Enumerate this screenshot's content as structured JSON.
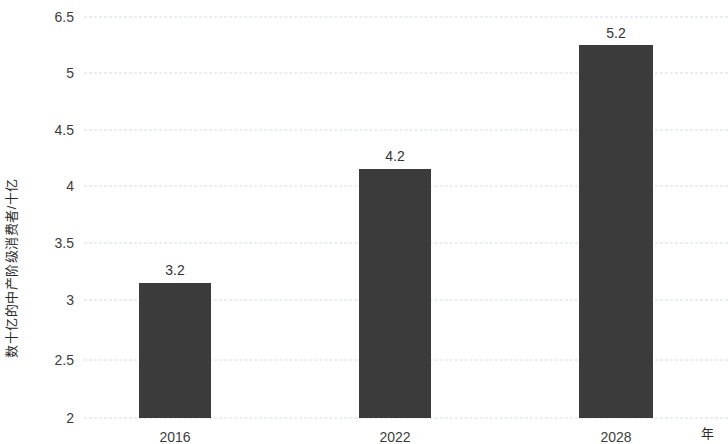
{
  "chart_data": {
    "type": "bar",
    "title": "",
    "subtitle": "",
    "xlabel": "年",
    "ylabel": "数十亿的中产阶级消费者/十亿",
    "categories": [
      "2016",
      "2022",
      "2028"
    ],
    "values": [
      3.2,
      4.2,
      5.2
    ],
    "data_labels": [
      "3.2",
      "4.2",
      "5.2"
    ],
    "series": [
      {
        "name": "",
        "values": [
          3.2,
          4.2,
          5.2
        ]
      }
    ],
    "ylim": [
      2,
      6.5
    ],
    "yticks": [
      2,
      2.5,
      3,
      3.5,
      4,
      4.5,
      5,
      6.5
    ],
    "ytick_labels": [
      "2",
      "2.5",
      "3",
      "3.5",
      "4",
      "4.5",
      "5",
      "6.5"
    ],
    "grid": true,
    "grid_style": "dotted-horizontal",
    "legend": false,
    "legend_position": "none",
    "colors": {
      "bar": "#3b3b3b",
      "grid": "#d6dbe2",
      "text": "#3c3c3c",
      "background": "#ffffff"
    },
    "geometry": {
      "plot_left": 84,
      "plot_width": 644,
      "gridline_y": [
        17,
        73,
        130,
        186,
        243,
        300,
        360,
        418
      ],
      "bars": [
        {
          "x": 55,
          "width": 72,
          "top": 283,
          "height": 135,
          "label_x": 91,
          "label_y": 262
        },
        {
          "x": 275,
          "width": 72,
          "top": 169,
          "height": 249,
          "label_x": 311,
          "label_y": 148
        },
        {
          "x": 495,
          "width": 74,
          "top": 45,
          "height": 373,
          "label_x": 532,
          "label_y": 25
        }
      ],
      "xtick_x": [
        91,
        311,
        532
      ],
      "xtick_y": 429
    }
  }
}
